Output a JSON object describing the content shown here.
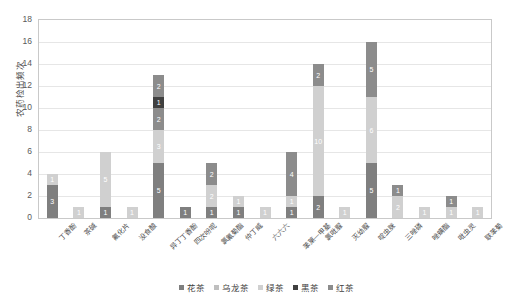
{
  "chart_data": {
    "type": "bar",
    "stacked": true,
    "title": "",
    "xlabel": "",
    "ylabel": "农药检出频次",
    "ylim": [
      0,
      18
    ],
    "yticks": [
      0,
      2,
      4,
      6,
      8,
      10,
      12,
      14,
      16,
      18
    ],
    "grid": true,
    "legend_position": "bottom",
    "categories": [
      "丁香酚",
      "茶碱",
      "氟化片",
      "没食酸",
      "异丁丁香酚",
      "四次吩呢",
      "氯氰菊酯",
      "仲丁威",
      "六六六",
      "苯莱一甲基",
      "氯吡脲",
      "灭幼脲",
      "啶虫脒",
      "三唑磷",
      "唑螨酯",
      "吡虫灵",
      "联苯菊"
    ],
    "series": [
      {
        "name": "花茶",
        "color": "#7f7f7f",
        "values": [
          3,
          0,
          1,
          0,
          5,
          1,
          1,
          1,
          0,
          1,
          2,
          0,
          5,
          0,
          0,
          0,
          0
        ]
      },
      {
        "name": "乌龙茶",
        "color": "#bfbfbf",
        "values": [
          0,
          0,
          0,
          0,
          0,
          0,
          0,
          0,
          0,
          0,
          0,
          0,
          0,
          0,
          0,
          0,
          0
        ]
      },
      {
        "name": "绿茶",
        "color": "#d0d0d0",
        "values": [
          1,
          1,
          5,
          1,
          3,
          0,
          2,
          1,
          1,
          1,
          10,
          1,
          6,
          2,
          1,
          1,
          1
        ]
      },
      {
        "name": "黑茶",
        "color": "#404040",
        "values": [
          0,
          0,
          0,
          0,
          1,
          0,
          0,
          0,
          0,
          0,
          0,
          0,
          0,
          0,
          0,
          0,
          0
        ]
      },
      {
        "name": "红茶",
        "color": "#8c8c8c",
        "values": [
          0,
          0,
          0,
          0,
          2,
          0,
          2,
          0,
          0,
          4,
          2,
          0,
          5,
          1,
          0,
          1,
          0
        ]
      }
    ],
    "totals": [
      4,
      1,
      6,
      1,
      13,
      1,
      5,
      2,
      1,
      6,
      14,
      1,
      16,
      3,
      1,
      2,
      1
    ],
    "bar_labels": [
      [
        {
          "v": "3",
          "s": "花茶"
        },
        {
          "v": "1",
          "s": "绿茶"
        }
      ],
      [
        {
          "v": "1",
          "s": "绿茶"
        }
      ],
      [
        {
          "v": "1",
          "s": "花茶"
        },
        {
          "v": "5",
          "s": "绿茶"
        }
      ],
      [
        {
          "v": "1",
          "s": "绿茶"
        }
      ],
      [
        {
          "v": "5",
          "s": "花茶"
        },
        {
          "v": "3",
          "s": "绿茶"
        },
        {
          "v": "2",
          "s": "红茶"
        },
        {
          "v": "1",
          "s": "黑茶"
        },
        {
          "v": "2",
          "s": "红茶"
        }
      ],
      [
        {
          "v": "1",
          "s": "花茶"
        }
      ],
      [
        {
          "v": "1",
          "s": "花茶"
        },
        {
          "v": "2",
          "s": "绿茶"
        },
        {
          "v": "2",
          "s": "红茶"
        }
      ],
      [
        {
          "v": "1",
          "s": "花茶"
        },
        {
          "v": "1",
          "s": "绿茶"
        }
      ],
      [
        {
          "v": "1",
          "s": "绿茶"
        }
      ],
      [
        {
          "v": "1",
          "s": "花茶"
        },
        {
          "v": "1",
          "s": "绿茶"
        },
        {
          "v": "4",
          "s": "红茶"
        }
      ],
      [
        {
          "v": "2",
          "s": "花茶"
        },
        {
          "v": "10",
          "s": "绿茶"
        },
        {
          "v": "2",
          "s": "红茶"
        }
      ],
      [
        {
          "v": "1",
          "s": "绿茶"
        }
      ],
      [
        {
          "v": "5",
          "s": "花茶"
        },
        {
          "v": "6",
          "s": "绿茶"
        },
        {
          "v": "5",
          "s": "红茶"
        }
      ],
      [
        {
          "v": "2",
          "s": "绿茶"
        },
        {
          "v": "1",
          "s": "红茶"
        }
      ],
      [
        {
          "v": "1",
          "s": "绿茶"
        }
      ],
      [
        {
          "v": "1",
          "s": "绿茶"
        },
        {
          "v": "1",
          "s": "红茶"
        }
      ],
      [
        {
          "v": "1",
          "s": "绿茶"
        }
      ]
    ]
  },
  "legend": {
    "items": [
      {
        "label": "花茶",
        "color": "#7f7f7f"
      },
      {
        "label": "乌龙茶",
        "color": "#bfbfbf"
      },
      {
        "label": "绿茶",
        "color": "#d0d0d0"
      },
      {
        "label": "黑茶",
        "color": "#404040"
      },
      {
        "label": "红茶",
        "color": "#8c8c8c"
      }
    ]
  }
}
